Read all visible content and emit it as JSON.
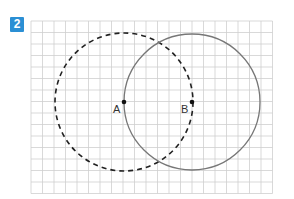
{
  "exercise": {
    "number": "2",
    "badge_color": "#2b8fd4"
  },
  "grid": {
    "x0": 31,
    "y0": 21,
    "cols": 21,
    "rows": 15,
    "cell": 11.5,
    "line_color": "#cfcfcf"
  },
  "points": [
    {
      "label": "A",
      "x": 124,
      "y": 102
    },
    {
      "label": "B",
      "x": 192,
      "y": 102
    }
  ],
  "circles": [
    {
      "center": "A",
      "radius": 69,
      "style": "dashed",
      "color": "#222222"
    },
    {
      "center": "B",
      "radius": 68,
      "style": "solid",
      "color": "#777777"
    }
  ]
}
